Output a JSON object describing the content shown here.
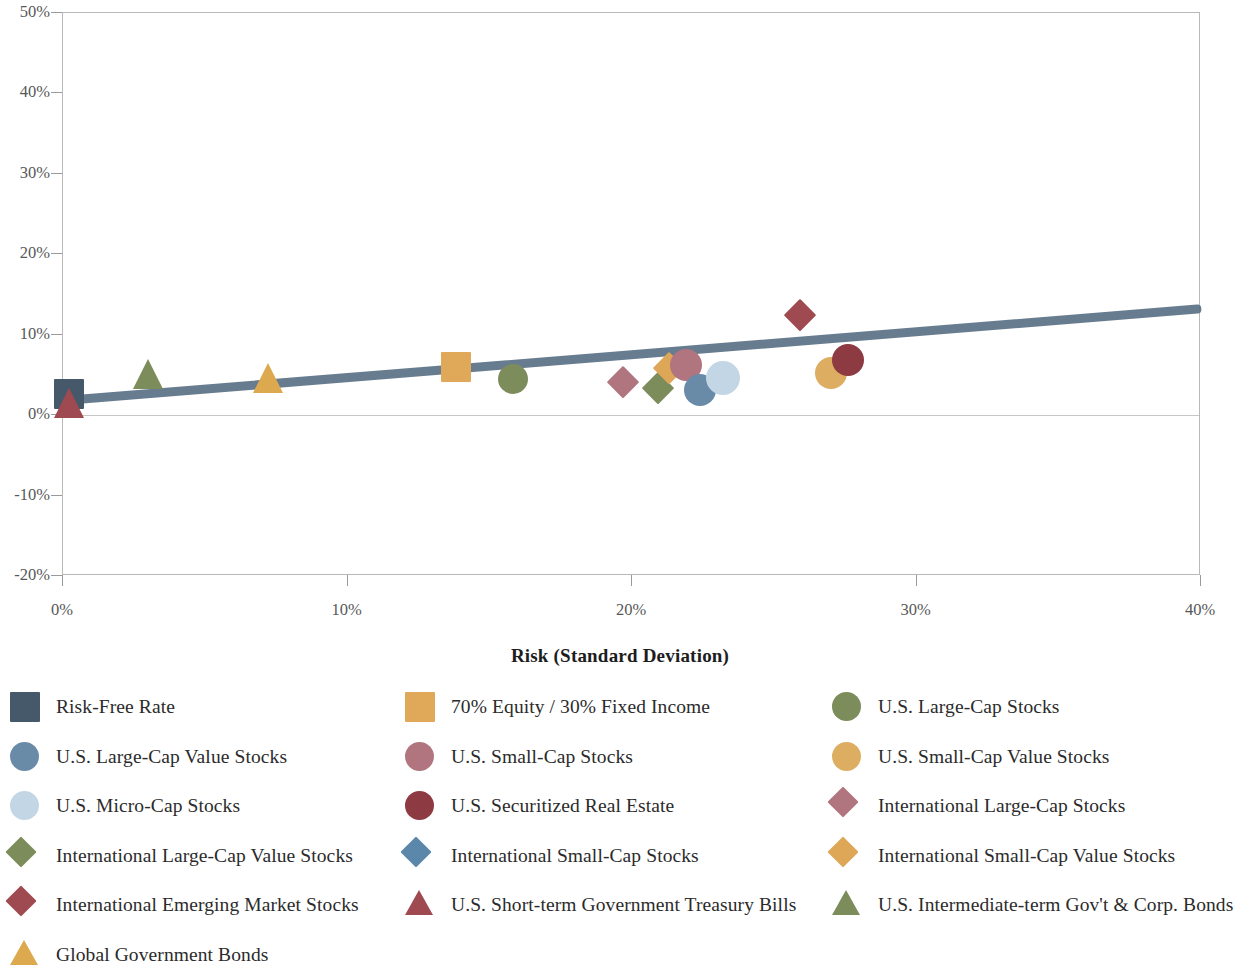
{
  "chart_data": {
    "type": "scatter",
    "title": "",
    "xlabel": "Risk (Standard Deviation)",
    "ylabel": "",
    "xlim": [
      0,
      40
    ],
    "ylim": [
      -20,
      50
    ],
    "xticks": [
      "0%",
      "10%",
      "20%",
      "30%",
      "40%"
    ],
    "xtick_values": [
      0,
      10,
      20,
      30,
      40
    ],
    "yticks": [
      "50%",
      "40%",
      "30%",
      "20%",
      "10%",
      "0%",
      "-10%",
      "-20%"
    ],
    "ytick_values": [
      50,
      40,
      30,
      20,
      10,
      0,
      -10,
      -20
    ],
    "grid": false,
    "zero_line": true,
    "legend_position": "bottom",
    "trendline": {
      "name": "capital-market-line",
      "color": "#5b7286",
      "x_start": 0,
      "y_start": 1.8,
      "x_end": 40,
      "y_end": 13.2,
      "width_px": 9
    },
    "points": [
      {
        "name": "Risk-Free Rate",
        "x": 0.2,
        "y": 2.6,
        "shape": "square",
        "color": "#46596b",
        "size": 30
      },
      {
        "name": "U.S. Short-term Government Treasury Bills",
        "x": 0.2,
        "y": 1.5,
        "shape": "triangle",
        "color": "#9e4a50",
        "size": 30
      },
      {
        "name": "U.S. Intermediate-term Gov't & Corp. Bonds",
        "x": 3.0,
        "y": 5.1,
        "shape": "triangle",
        "color": "#7d8c5b",
        "size": 30
      },
      {
        "name": "Global Government Bonds",
        "x": 7.2,
        "y": 4.6,
        "shape": "triangle",
        "color": "#dda94f",
        "size": 30
      },
      {
        "name": "70% Equity / 30% Fixed Income",
        "x": 13.8,
        "y": 6.0,
        "shape": "square",
        "color": "#dfa959",
        "size": 30
      },
      {
        "name": "U.S. Large-Cap Stocks",
        "x": 15.8,
        "y": 4.5,
        "shape": "circle",
        "color": "#7d8c5b",
        "size": 30
      },
      {
        "name": "International Large-Cap Stocks",
        "x": 19.7,
        "y": 4.1,
        "shape": "diamond",
        "color": "#b0757e",
        "size": 30
      },
      {
        "name": "International Large-Cap Value Stocks",
        "x": 20.9,
        "y": 3.4,
        "shape": "diamond",
        "color": "#7d8c5b",
        "size": 30
      },
      {
        "name": "International Small-Cap Value Stocks",
        "x": 21.3,
        "y": 5.9,
        "shape": "diamond",
        "color": "#dda757",
        "size": 30
      },
      {
        "name": "U.S. Small-Cap Stocks",
        "x": 21.9,
        "y": 6.2,
        "shape": "circle",
        "color": "#b0757e",
        "size": 32
      },
      {
        "name": "U.S. Large-Cap Value Stocks",
        "x": 22.4,
        "y": 3.1,
        "shape": "circle",
        "color": "#6a8ba8",
        "size": 32
      },
      {
        "name": "U.S. Micro-Cap Stocks",
        "x": 23.2,
        "y": 4.6,
        "shape": "circle",
        "color": "#c3d6e5",
        "size": 34
      },
      {
        "name": "International Emerging Market Stocks",
        "x": 25.9,
        "y": 12.4,
        "shape": "diamond",
        "color": "#9e4a50",
        "size": 30
      },
      {
        "name": "U.S. Small-Cap Value Stocks",
        "x": 27.0,
        "y": 5.3,
        "shape": "circle",
        "color": "#ddad62",
        "size": 32
      },
      {
        "name": "U.S. Securitized Real Estate",
        "x": 27.6,
        "y": 6.9,
        "shape": "circle",
        "color": "#8e3a42",
        "size": 32
      }
    ]
  },
  "axis": {
    "x_title": "Risk (Standard Deviation)"
  },
  "legend": {
    "items": [
      {
        "label": "Risk-Free Rate",
        "shape": "square",
        "color": "#46596b"
      },
      {
        "label": "70% Equity / 30% Fixed Income",
        "shape": "square",
        "color": "#dfa959"
      },
      {
        "label": "U.S. Large-Cap Stocks",
        "shape": "circle",
        "color": "#7d8c5b"
      },
      {
        "label": "U.S. Large-Cap Value Stocks",
        "shape": "circle",
        "color": "#6a8ba8"
      },
      {
        "label": "U.S. Small-Cap Stocks",
        "shape": "circle",
        "color": "#b0757e"
      },
      {
        "label": "U.S. Small-Cap Value Stocks",
        "shape": "circle",
        "color": "#ddad62"
      },
      {
        "label": "U.S. Micro-Cap Stocks",
        "shape": "circle",
        "color": "#c3d6e5"
      },
      {
        "label": "U.S. Securitized Real Estate",
        "shape": "circle",
        "color": "#8e3a42"
      },
      {
        "label": "International Large-Cap Stocks",
        "shape": "diamond",
        "color": "#b0757e"
      },
      {
        "label": "International Large-Cap Value Stocks",
        "shape": "diamond",
        "color": "#7d8c5b"
      },
      {
        "label": "International Small-Cap Stocks",
        "shape": "diamond",
        "color": "#5b87ab"
      },
      {
        "label": "International Small-Cap Value Stocks",
        "shape": "diamond",
        "color": "#dda757"
      },
      {
        "label": "International Emerging Market Stocks",
        "shape": "diamond",
        "color": "#9e4a50"
      },
      {
        "label": "U.S. Short-term Government Treasury Bills",
        "shape": "triangle",
        "color": "#9e4a50"
      },
      {
        "label": "U.S. Intermediate-term Gov't & Corp. Bonds",
        "shape": "triangle",
        "color": "#7d8c5b"
      },
      {
        "label": "Global Government Bonds",
        "shape": "triangle",
        "color": "#dda94f"
      }
    ]
  }
}
